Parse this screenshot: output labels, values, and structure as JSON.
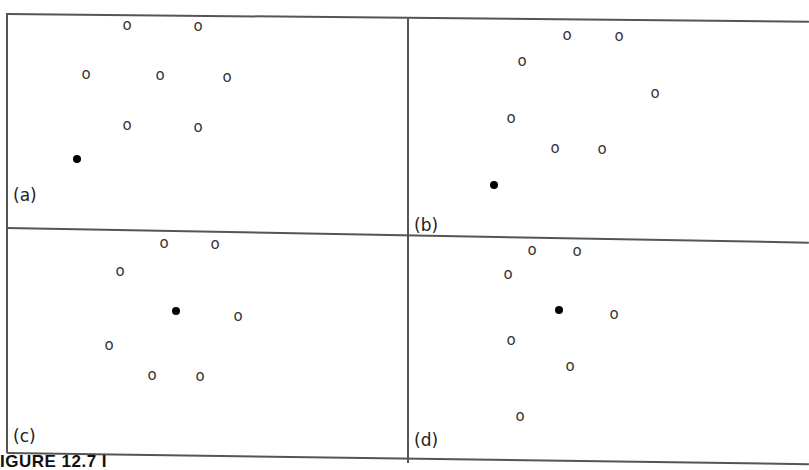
{
  "figure": {
    "caption_fragment": "IGURE 12.7   I",
    "panels": [
      {
        "label": "(a)",
        "dot": {
          "x": 77,
          "y": 159
        },
        "points": [
          {
            "x": 127,
            "y": 25
          },
          {
            "x": 198,
            "y": 26
          },
          {
            "x": 86,
            "y": 74
          },
          {
            "x": 160,
            "y": 75
          },
          {
            "x": 227,
            "y": 77
          },
          {
            "x": 127,
            "y": 125
          },
          {
            "x": 198,
            "y": 127
          }
        ],
        "label_pos": {
          "x": 13,
          "y": 185
        }
      },
      {
        "label": "(b)",
        "dot": {
          "x": 494,
          "y": 185
        },
        "points": [
          {
            "x": 567,
            "y": 35
          },
          {
            "x": 619,
            "y": 36
          },
          {
            "x": 522,
            "y": 61
          },
          {
            "x": 655,
            "y": 93
          },
          {
            "x": 511,
            "y": 118
          },
          {
            "x": 555,
            "y": 148
          },
          {
            "x": 602,
            "y": 149
          }
        ],
        "label_pos": {
          "x": 414,
          "y": 215
        }
      },
      {
        "label": "(c)",
        "dot": {
          "x": 176,
          "y": 311
        },
        "points": [
          {
            "x": 164,
            "y": 243
          },
          {
            "x": 215,
            "y": 244
          },
          {
            "x": 120,
            "y": 271
          },
          {
            "x": 238,
            "y": 316
          },
          {
            "x": 109,
            "y": 345
          },
          {
            "x": 152,
            "y": 375
          },
          {
            "x": 200,
            "y": 376
          }
        ],
        "label_pos": {
          "x": 13,
          "y": 426
        }
      },
      {
        "label": "(d)",
        "dot": {
          "x": 559,
          "y": 310
        },
        "points": [
          {
            "x": 532,
            "y": 250
          },
          {
            "x": 577,
            "y": 251
          },
          {
            "x": 508,
            "y": 274
          },
          {
            "x": 614,
            "y": 314
          },
          {
            "x": 511,
            "y": 340
          },
          {
            "x": 570,
            "y": 366
          },
          {
            "x": 520,
            "y": 416
          }
        ],
        "label_pos": {
          "x": 414,
          "y": 430
        }
      }
    ]
  }
}
